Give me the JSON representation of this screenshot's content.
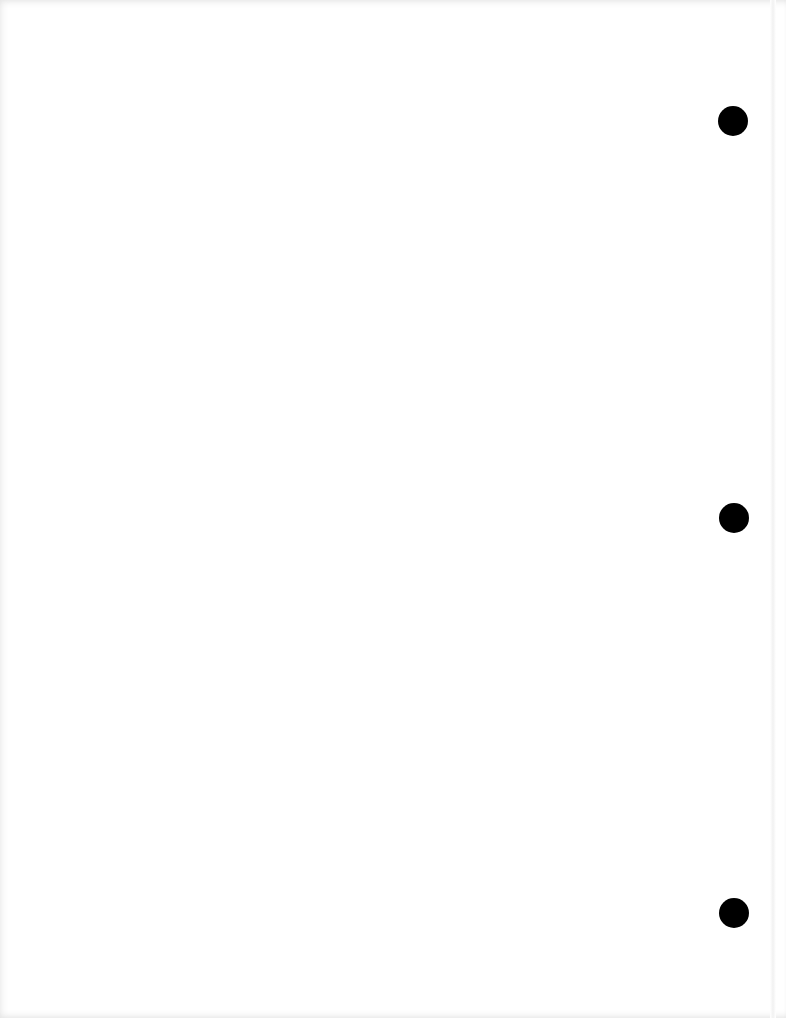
{
  "document": {
    "type": "blank scanned page",
    "text": ""
  },
  "punch_holes": [
    {
      "cx": 733,
      "cy": 121,
      "diameter": 30,
      "color": "#000000"
    },
    {
      "cx": 734,
      "cy": 518,
      "diameter": 30,
      "color": "#000000"
    },
    {
      "cx": 734,
      "cy": 913,
      "diameter": 30,
      "color": "#000000"
    }
  ],
  "colors": {
    "paper": "#ffffff",
    "hole": "#000000"
  }
}
